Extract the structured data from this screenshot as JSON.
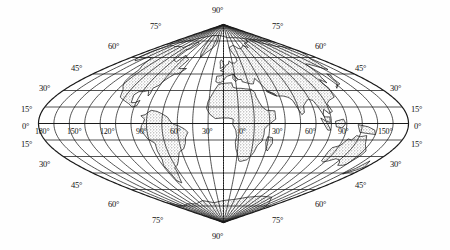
{
  "figure": {
    "kind": "world-map",
    "projection": "sinusoidal",
    "title": "",
    "background_color": "#ffffff",
    "graticule_color": "#1a1a1a",
    "land_fill_color": "#cfcfcf",
    "land_outline_color": "#111111",
    "ocean_color": "#ffffff"
  },
  "chart_data": {
    "type": "map",
    "projection": "sinusoidal",
    "central_meridian": 0,
    "graticule": {
      "parallel_interval_deg": 15,
      "meridian_interval_deg": 15,
      "latitude_range": [
        -90,
        90
      ],
      "longitude_range": [
        -180,
        180
      ],
      "grid": true
    },
    "latitude_labels": [
      "90°",
      "75°",
      "60°",
      "45°",
      "30°",
      "15°",
      "0°",
      "15°",
      "30°",
      "45°",
      "60°",
      "75°",
      "90°"
    ],
    "longitude_labels_left": [
      "180°",
      "150°",
      "120°",
      "90°",
      "60°",
      "30°"
    ],
    "longitude_labels_center": [
      "0°"
    ],
    "longitude_labels_right": [
      "30°",
      "60°",
      "90°",
      "150°"
    ]
  },
  "labels": {
    "pole_north": "90°",
    "pole_south": "90°",
    "left_upper": [
      "75°",
      "60°",
      "45°",
      "30°",
      "15°"
    ],
    "left_equator": "0°",
    "left_lower": [
      "15°",
      "30°",
      "45°",
      "60°",
      "75°"
    ],
    "right_upper": [
      "75°",
      "60°",
      "45°",
      "30°",
      "15°"
    ],
    "right_equator": "0°",
    "right_lower": [
      "15°",
      "30°",
      "45°",
      "60°",
      "75°"
    ],
    "equator_row": [
      "180°",
      "150°",
      "120°",
      "90°",
      "60°",
      "30°",
      "0°",
      "30°",
      "60°",
      "90°",
      "150°"
    ]
  }
}
